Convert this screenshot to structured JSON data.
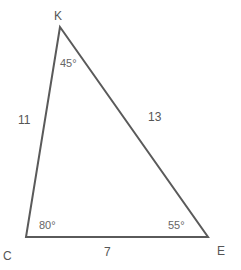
{
  "diagram": {
    "type": "triangle",
    "colors": {
      "line": "#5a5a5a",
      "text": "#555555"
    },
    "vertices": [
      {
        "name": "K",
        "x": 60,
        "y": 27
      },
      {
        "name": "C",
        "x": 26,
        "y": 237
      },
      {
        "name": "E",
        "x": 208,
        "y": 237
      }
    ],
    "sides": [
      {
        "between": "K-C",
        "length": "11"
      },
      {
        "between": "K-E",
        "length": "13"
      },
      {
        "between": "C-E",
        "length": "7"
      }
    ],
    "angles": [
      {
        "vertex": "K",
        "value": "45°"
      },
      {
        "vertex": "C",
        "value": "80°"
      },
      {
        "vertex": "E",
        "value": "55°"
      }
    ]
  }
}
